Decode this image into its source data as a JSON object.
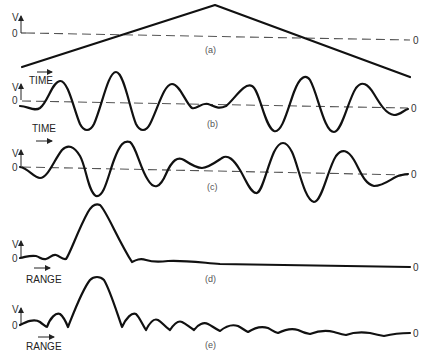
{
  "figure": {
    "panels": [
      {
        "id": "a",
        "caption": "(a)",
        "y_axis_label": "V",
        "zero_label_left": "0",
        "zero_label_right": "0",
        "axis_direction_label": "",
        "description": "Triangular (linear FM up/down) voltage ramp"
      },
      {
        "id": "b",
        "caption": "(b)",
        "y_axis_label": "V",
        "zero_label_left": "0",
        "zero_label_right": "0",
        "axis_direction_label": "TIME",
        "description": "Oscillating waveform vs time"
      },
      {
        "id": "c",
        "caption": "(c)",
        "y_axis_label": "V",
        "zero_label_left": "0",
        "zero_label_right": "0",
        "axis_direction_label": "TIME",
        "description": "Oscillating waveform vs time"
      },
      {
        "id": "d",
        "caption": "(d)",
        "y_axis_label": "V",
        "zero_label_left": "0",
        "zero_label_right": "0",
        "axis_direction_label": "RANGE",
        "description": "Range response with single peak and low sidelobes"
      },
      {
        "id": "e",
        "caption": "(e)",
        "y_axis_label": "V",
        "zero_label_left": "0",
        "zero_label_right": "0",
        "axis_direction_label": "RANGE",
        "description": "Range response with single peak and higher sidelobes"
      }
    ],
    "colors": {
      "stroke": "#111111",
      "dashed_zero": "#555555",
      "caption": "#555555"
    }
  }
}
